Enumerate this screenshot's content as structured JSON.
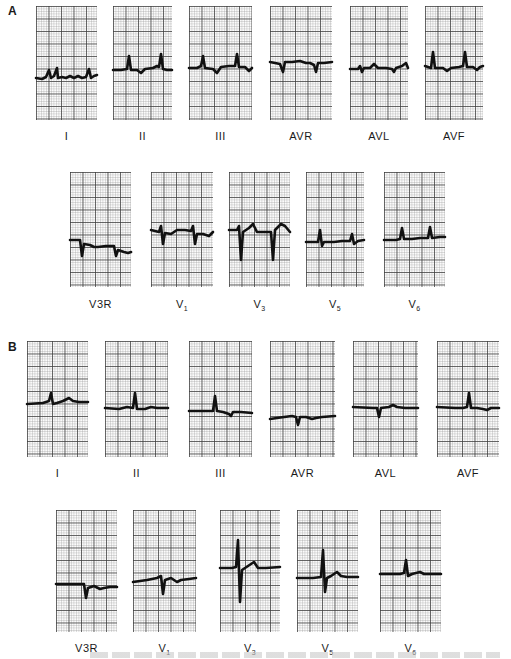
{
  "figure": {
    "panels": [
      {
        "letter": "A",
        "rows": [
          {
            "leads": [
              {
                "label": "I",
                "sub": "",
                "x": 36,
                "y": 6,
                "w": 61,
                "h": 114,
                "trace": "0,72 6,73 10,71 13,64 15,72 18,70 21,62 22,72 26,71 30,72 34,70 38,72 42,70 46,72 50,71 53,63 55,72 58,70 61,69"
              },
              {
                "label": "II",
                "sub": "",
                "x": 113,
                "y": 6,
                "w": 59,
                "h": 114,
                "trace": "0,64 8,64 14,63 16,50 18,64 24,64 28,67 32,63 40,62 44,60 46,61 48,48 50,63 54,64 59,64"
              },
              {
                "label": "III",
                "sub": "",
                "x": 189,
                "y": 6,
                "w": 63,
                "h": 114,
                "trace": "0,62 8,62 12,60 14,50 16,62 24,63 28,67 32,61 40,60 46,60 48,48 50,61 56,61 60,65 63,62"
              },
              {
                "label": "AVR",
                "sub": "",
                "x": 270,
                "y": 6,
                "w": 62,
                "h": 114,
                "trace": "0,56 10,58 13,66 15,56 22,56 30,55 36,57 40,57 44,59 46,66 48,57 54,57 62,56"
              },
              {
                "label": "AVL",
                "sub": "",
                "x": 350,
                "y": 6,
                "w": 58,
                "h": 114,
                "trace": "0,63 8,63 10,60 12,66 14,62 20,62 24,58 28,62 36,62 42,63 44,66 46,62 52,60 56,57 58,62"
              },
              {
                "label": "AVF",
                "sub": "",
                "x": 425,
                "y": 6,
                "w": 58,
                "h": 114,
                "trace": "0,60 6,62 8,46 10,62 18,62 22,65 26,62 34,61 38,60 40,46 42,61 48,61 52,64 55,61 58,60"
              }
            ]
          },
          {
            "leads": [
              {
                "label": "V3R",
                "sub": "",
                "x": 70,
                "y": 172,
                "w": 61,
                "h": 115,
                "trace": "0,68 10,68 12,84 14,72 20,73 24,75 28,75 36,74 44,74 46,84 48,78 54,80 58,81 61,80"
              },
              {
                "label": "V",
                "sub": "1",
                "x": 151,
                "y": 172,
                "w": 62,
                "h": 115,
                "trace": "0,58 8,60 10,54 12,72 14,61 20,62 26,58 34,58 40,59 42,54 44,72 46,62 52,62 58,64 62,60"
              },
              {
                "label": "V",
                "sub": "3",
                "x": 229,
                "y": 172,
                "w": 61,
                "h": 115,
                "trace": "0,58 8,58 10,54 12,88 14,60 20,56 24,52 28,60 36,60 42,60 44,88 46,58 52,52 56,54 61,60"
              },
              {
                "label": "V",
                "sub": "5",
                "x": 306,
                "y": 172,
                "w": 58,
                "h": 115,
                "trace": "0,70 12,70 14,58 16,74 18,70 28,70 36,69 44,69 46,62 48,72 52,69 58,68"
              },
              {
                "label": "V",
                "sub": "6",
                "x": 384,
                "y": 172,
                "w": 61,
                "h": 115,
                "trace": "0,68 12,68 16,67 18,56 20,67 28,67 36,66 44,66 46,55 48,66 56,65 61,65"
              }
            ]
          }
        ]
      },
      {
        "letter": "B",
        "rows": [
          {
            "leads": [
              {
                "label": "I",
                "sub": "",
                "x": 27,
                "y": 341,
                "w": 61,
                "h": 116,
                "trace": "0,63 16,62 22,60 24,52 26,63 30,62 36,60 42,57 46,60 52,61 61,61"
              },
              {
                "label": "II",
                "sub": "",
                "x": 105,
                "y": 341,
                "w": 63,
                "h": 116,
                "trace": "0,67 14,68 22,66 28,67 30,52 32,68 40,68 46,66 52,67 63,67"
              },
              {
                "label": "III",
                "sub": "",
                "x": 189,
                "y": 341,
                "w": 63,
                "h": 116,
                "trace": "0,70 20,70 24,70 26,55 28,70 34,71 40,73 42,75 44,71 52,71 63,72"
              },
              {
                "label": "AVR",
                "sub": "",
                "x": 270,
                "y": 341,
                "w": 65,
                "h": 116,
                "trace": "0,78 14,76 22,75 26,76 28,84 30,76 36,76 42,78 46,77 52,76 65,75"
              },
              {
                "label": "AVL",
                "sub": "",
                "x": 353,
                "y": 341,
                "w": 65,
                "h": 116,
                "trace": "0,66 20,67 24,67 26,76 28,67 36,66 40,64 44,66 52,67 65,67"
              },
              {
                "label": "AVF",
                "sub": "",
                "x": 437,
                "y": 341,
                "w": 62,
                "h": 116,
                "trace": "0,66 18,67 26,67 30,66 32,52 34,67 40,67 46,68 50,69 54,67 62,67"
              }
            ]
          },
          {
            "leads": [
              {
                "label": "V3R",
                "sub": "",
                "x": 56,
                "y": 510,
                "w": 61,
                "h": 122,
                "trace": "0,74 26,74 28,74 30,88 32,78 38,76 44,79 48,78 54,77 61,77"
              },
              {
                "label": "V",
                "sub": "1",
                "x": 133,
                "y": 510,
                "w": 63,
                "h": 122,
                "trace": "0,72 14,70 24,68 28,66 30,84 32,70 38,68 44,72 48,70 56,69 63,68"
              },
              {
                "label": "V",
                "sub": "3",
                "x": 220,
                "y": 510,
                "w": 60,
                "h": 122,
                "trace": "0,58 12,58 16,57 18,30 20,92 22,60 28,56 34,52 38,58 46,58 60,57"
              },
              {
                "label": "V",
                "sub": "5",
                "x": 297,
                "y": 510,
                "w": 61,
                "h": 122,
                "trace": "0,68 16,68 24,67 26,40 28,82 30,68 34,66 40,62 44,66 50,67 61,67"
              },
              {
                "label": "V",
                "sub": "6",
                "x": 380,
                "y": 510,
                "w": 61,
                "h": 122,
                "trace": "0,64 20,64 24,63 26,50 28,66 32,64 40,62 44,64 50,64 61,64"
              }
            ]
          }
        ]
      }
    ],
    "label_offsets": {
      "A_row0": 130,
      "A_row1": 298,
      "B_row0": 467,
      "B_row1": 642
    }
  }
}
